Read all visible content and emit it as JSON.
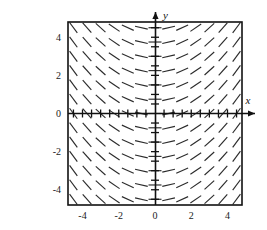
{
  "panel": {
    "label": "(C)"
  },
  "axes": {
    "x_label": "x",
    "y_label": "y",
    "x_ticks": [
      "-4",
      "-2",
      "0",
      "2",
      "4"
    ],
    "y_ticks": [
      "4",
      "2",
      "0",
      "-2",
      "-4"
    ]
  },
  "chart_data": {
    "type": "scatter",
    "plot_kind": "direction-field",
    "title": "",
    "xlabel": "x",
    "ylabel": "y",
    "xlim": [
      -4.8,
      4.8
    ],
    "ylim": [
      -4.8,
      4.8
    ],
    "xticks": [
      -4,
      -2,
      0,
      2,
      4
    ],
    "yticks": [
      -4,
      -2,
      0,
      2,
      4
    ],
    "minor_tick_step": 0.5,
    "grid": false,
    "legend": null,
    "slope_rule": "dy/dx = x",
    "slope_depends_on": "x-only",
    "grid_x": [
      -4.5,
      -3.75,
      -3.0,
      -2.25,
      -1.5,
      -0.75,
      0,
      0.75,
      1.5,
      2.25,
      3.0,
      3.75,
      4.5
    ],
    "grid_y": [
      -4.5,
      -3.75,
      -3.0,
      -2.25,
      -1.5,
      -0.75,
      0,
      0.75,
      1.5,
      2.25,
      3.0,
      3.75,
      4.5
    ],
    "slopes_by_x": [
      -4.5,
      -3.75,
      -3.0,
      -2.25,
      -1.5,
      -0.75,
      0,
      0.75,
      1.5,
      2.25,
      3.0,
      3.75,
      4.5
    ],
    "segment_length_px": 13,
    "stroke_color": "#2b2b2b",
    "frame_color": "#111111",
    "axis_color": "#111111",
    "background": "#ffffff"
  }
}
